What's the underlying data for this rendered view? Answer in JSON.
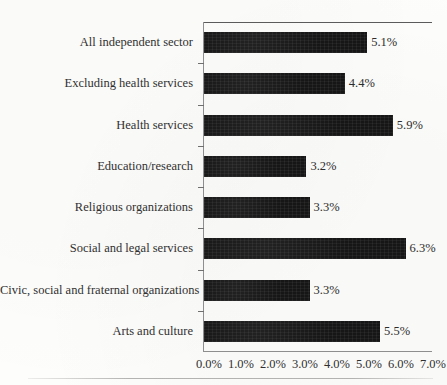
{
  "chart_data": {
    "type": "bar",
    "orientation": "horizontal",
    "title": "",
    "xlabel": "",
    "ylabel": "",
    "xlim": [
      0,
      7
    ],
    "grid": false,
    "legend": false,
    "categories": [
      "All independent sector",
      "Excluding health services",
      "Health services",
      "Education/research",
      "Religious organizations",
      "Social and legal services",
      "Civic, social and fraternal organizations",
      "Arts and culture"
    ],
    "values": [
      5.1,
      4.4,
      5.9,
      3.2,
      3.3,
      6.3,
      3.3,
      5.5
    ],
    "value_labels": [
      "5.1%",
      "4.4%",
      "5.9%",
      "3.2%",
      "3.3%",
      "6.3%",
      "3.3%",
      "5.5%"
    ],
    "xticks": [
      0,
      1,
      2,
      3,
      4,
      5,
      6,
      7
    ],
    "xtick_labels": [
      "0.0%",
      "1.0%",
      "2.0%",
      "3.0%",
      "4.0%",
      "5.0%",
      "6.0%",
      "7.0%"
    ],
    "bar_color": "#161616",
    "axis_color": "#8e8e8e",
    "background_color": "#fdfdfb"
  }
}
